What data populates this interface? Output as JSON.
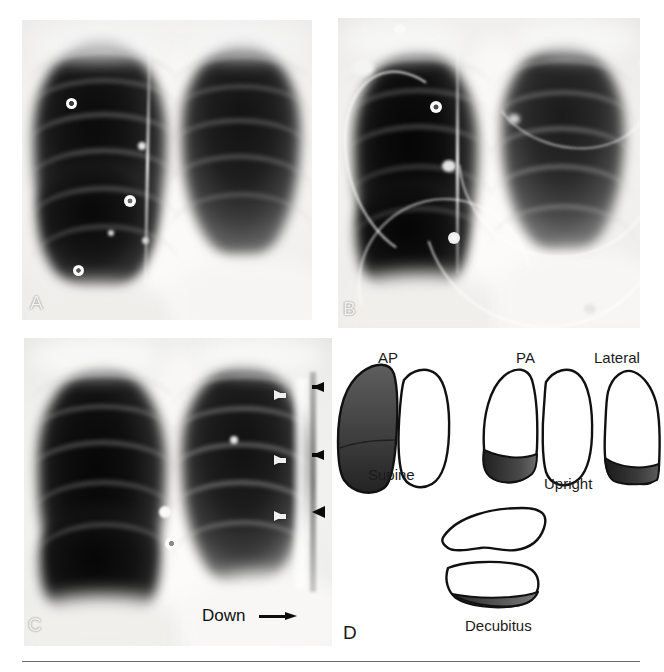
{
  "figure": {
    "panels": [
      {
        "id": "A",
        "label": "A",
        "type": "chest-radiograph",
        "description": "Upright frontal chest radiograph showing large right-sided lucency with visible pleural line and radiopaque skin markers"
      },
      {
        "id": "B",
        "label": "B",
        "type": "chest-radiograph",
        "description": "Supine portable chest radiograph with overlying monitoring leads and tubing"
      },
      {
        "id": "C",
        "label": "C",
        "type": "chest-radiograph",
        "description": "Frontal chest radiograph with white arrows and black arrows marking the lateral pleural edge",
        "annotations": {
          "white_arrows": 3,
          "black_arrows": 2,
          "black_arrowheads": 1,
          "orientation_label": "Down"
        }
      },
      {
        "id": "D",
        "label": "D",
        "type": "line-diagram",
        "description": "Schematic of pleural fluid distribution by patient position and projection",
        "diagram_labels": [
          {
            "text": "AP",
            "role": "projection"
          },
          {
            "text": "PA",
            "role": "projection"
          },
          {
            "text": "Lateral",
            "role": "projection"
          },
          {
            "text": "Supine",
            "role": "position"
          },
          {
            "text": "Upright",
            "role": "position"
          },
          {
            "text": "Decubitus",
            "role": "position"
          }
        ]
      }
    ],
    "colors": {
      "shading_fill": "#3a3a3a",
      "outline": "#111111",
      "background": "#ffffff",
      "white_arrow": "#efefef",
      "black_arrow": "#0a0a0a"
    }
  }
}
